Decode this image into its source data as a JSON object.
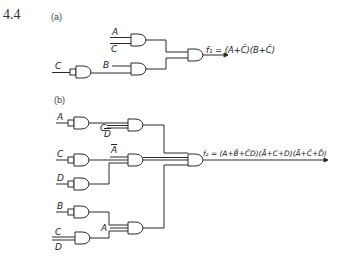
{
  "problem_number": "4.4",
  "part_a": {
    "label": "(a)",
    "inputs": {
      "A": "A",
      "C_bar": "C",
      "C": "C",
      "B": "B"
    },
    "output_expr": "f₁ = (A+C̄)(B+C̄)"
  },
  "part_b": {
    "label": "(b)",
    "inputs": {
      "A": "A",
      "C1": "C",
      "D1": "D",
      "C2": "C",
      "D2": "D",
      "A_bar": "A",
      "D3": "D",
      "B": "B",
      "A2": "A",
      "C3": "C",
      "D4": "D"
    },
    "output_expr": "f₂ = (A+B̄+C̄D)(Ā+C+D)(Ā+C̄+D̄)"
  },
  "colors": {
    "line": "#2a2a2a",
    "text": "#222222",
    "background": "#ffffff"
  }
}
